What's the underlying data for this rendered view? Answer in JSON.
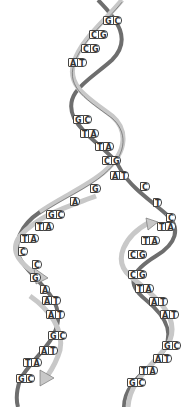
{
  "diagram": {
    "type": "dna-replication-fork",
    "colors": {
      "strand_light": "#c8c8c8",
      "strand_dark": "#6e6e6e",
      "outline": "#444444",
      "background": "#ffffff"
    },
    "parent_helix": {
      "pairs": [
        {
          "a": "G",
          "b": "C",
          "x": 103,
          "y": 16
        },
        {
          "a": "C",
          "b": "G",
          "x": 89,
          "y": 30
        },
        {
          "a": "C",
          "b": "G",
          "x": 81,
          "y": 44
        },
        {
          "a": "A",
          "b": "T",
          "x": 68,
          "y": 58
        },
        {
          "a": "G",
          "b": "C",
          "x": 73,
          "y": 115
        },
        {
          "a": "T",
          "b": "A",
          "x": 80,
          "y": 129
        },
        {
          "a": "T",
          "b": "A",
          "x": 95,
          "y": 142
        },
        {
          "a": "C",
          "b": "G",
          "x": 102,
          "y": 156
        },
        {
          "a": "A",
          "b": "T",
          "x": 110,
          "y": 171
        }
      ]
    },
    "unpaired": [
      {
        "base": "G",
        "x": 90,
        "y": 184
      },
      {
        "base": "A",
        "x": 70,
        "y": 197
      },
      {
        "base": "C",
        "x": 140,
        "y": 182
      },
      {
        "base": "T",
        "x": 153,
        "y": 198
      },
      {
        "base": "C",
        "x": 166,
        "y": 213
      }
    ],
    "left_daughter": {
      "pairs": [
        {
          "a": "G",
          "b": "C",
          "x": 46,
          "y": 210
        },
        {
          "a": "T",
          "b": "A",
          "x": 35,
          "y": 222
        },
        {
          "a": "T",
          "b": "A",
          "x": 20,
          "y": 234
        },
        {
          "a": "C",
          "b": "",
          "x": 18,
          "y": 247
        },
        {
          "a": "C",
          "b": "",
          "x": 32,
          "y": 260
        },
        {
          "a": "G",
          "b": "",
          "x": 30,
          "y": 273
        },
        {
          "a": "A",
          "b": "",
          "x": 40,
          "y": 285
        },
        {
          "a": "A",
          "b": "T",
          "x": 42,
          "y": 296
        },
        {
          "a": "A",
          "b": "T",
          "x": 46,
          "y": 310
        },
        {
          "a": "G",
          "b": "C",
          "x": 48,
          "y": 331
        },
        {
          "a": "A",
          "b": "T",
          "x": 39,
          "y": 346
        },
        {
          "a": "T",
          "b": "A",
          "x": 23,
          "y": 358
        },
        {
          "a": "G",
          "b": "C",
          "x": 16,
          "y": 374
        }
      ]
    },
    "right_daughter": {
      "pairs": [
        {
          "a": "T",
          "b": "A",
          "x": 157,
          "y": 222
        },
        {
          "a": "T",
          "b": "A",
          "x": 141,
          "y": 236
        },
        {
          "a": "C",
          "b": "G",
          "x": 128,
          "y": 250
        },
        {
          "a": "C",
          "b": "G",
          "x": 128,
          "y": 270
        },
        {
          "a": "T",
          "b": "A",
          "x": 135,
          "y": 284
        },
        {
          "a": "A",
          "b": "T",
          "x": 149,
          "y": 297
        },
        {
          "a": "A",
          "b": "T",
          "x": 160,
          "y": 310
        },
        {
          "a": "G",
          "b": "C",
          "x": 162,
          "y": 341
        },
        {
          "a": "A",
          "b": "T",
          "x": 153,
          "y": 354
        },
        {
          "a": "T",
          "b": "A",
          "x": 139,
          "y": 366
        },
        {
          "a": "G",
          "b": "C",
          "x": 127,
          "y": 378
        }
      ]
    }
  }
}
